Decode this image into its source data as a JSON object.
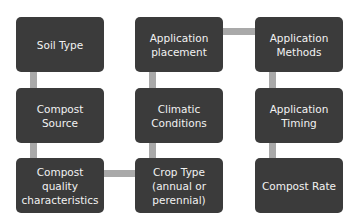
{
  "diagram": {
    "title": "",
    "colors": {
      "node_fill": "#3b3b3b",
      "node_text": "#f2f2f2",
      "connector": "#a9a9a9",
      "background": "#ffffff"
    },
    "nodes": [
      {
        "id": "soil-type",
        "label": "Soil Type"
      },
      {
        "id": "compost-source",
        "label": "Compost\nSource"
      },
      {
        "id": "compost-quality",
        "label": "Compost\nquality\ncharacteristics"
      },
      {
        "id": "crop-type",
        "label": "Crop Type\n(annual or\nperennial)"
      },
      {
        "id": "climatic-conditions",
        "label": "Climatic\nConditions"
      },
      {
        "id": "application-placement",
        "label": "Application\nplacement"
      },
      {
        "id": "application-methods",
        "label": "Application\nMethods"
      },
      {
        "id": "application-timing",
        "label": "Application\nTiming"
      },
      {
        "id": "compost-rate",
        "label": "Compost Rate"
      }
    ],
    "edges": [
      [
        "soil-type",
        "compost-source"
      ],
      [
        "compost-source",
        "compost-quality"
      ],
      [
        "compost-quality",
        "crop-type"
      ],
      [
        "crop-type",
        "climatic-conditions"
      ],
      [
        "climatic-conditions",
        "application-placement"
      ],
      [
        "application-placement",
        "application-methods"
      ],
      [
        "application-methods",
        "application-timing"
      ],
      [
        "application-timing",
        "compost-rate"
      ]
    ]
  }
}
